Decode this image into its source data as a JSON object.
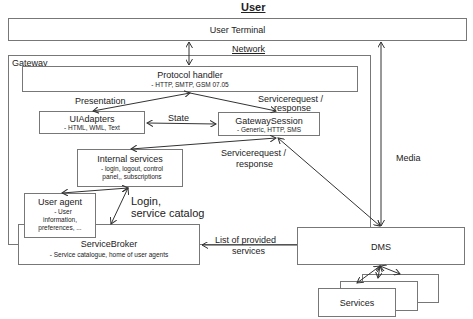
{
  "title": "User",
  "network_label": "Network",
  "user_terminal": {
    "label": "User Terminal"
  },
  "gateway": {
    "label": "Gateway",
    "protocol_handler": {
      "title": "Protocol handler",
      "detail": "- HTTP, SMTP, GSM 07.05"
    },
    "ui_adapters": {
      "title": "UIAdapters",
      "detail": "- HTML, WML, Text"
    },
    "gateway_session": {
      "title": "GatewaySession",
      "detail": "- Generic, HTTP, SMS"
    },
    "internal_services": {
      "title": "Internal services",
      "detail_1": "- login, logout, control",
      "detail_2": "panel,, subscriptions"
    }
  },
  "user_agent": {
    "title": "User agent",
    "detail_1": "- User",
    "detail_2": "information,",
    "detail_3": "preferences, ..."
  },
  "service_broker": {
    "title": "ServiceBroker",
    "detail": "- Service catalogue, home of user agents"
  },
  "dms": {
    "label": "DMS"
  },
  "services": {
    "label": "Services"
  },
  "edges": {
    "presentation": "Presentation",
    "state": "State",
    "servicerequest_1_a": "Servicerequest /",
    "servicerequest_1_b": "response",
    "servicerequest_2_a": "Servicerequest /",
    "servicerequest_2_b": "response",
    "login_a": "Login,",
    "login_b": "service catalog",
    "provided_a": "List of provided",
    "provided_b": "services",
    "media": "Media"
  }
}
